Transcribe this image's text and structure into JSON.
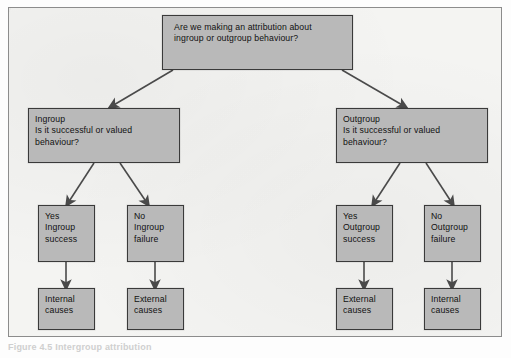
{
  "figure": {
    "caption": "Figure 4.5  Intergroup attribution",
    "colors": {
      "node_fill": "#b9b9b9",
      "node_border": "#3a3a3a",
      "panel_background": "#f4f4f2",
      "panel_border": "#8c8c8c",
      "arrow": "#4a4a4a"
    }
  },
  "nodes": {
    "question_root": "Are we making an attribution about\ningroup or outgroup behaviour?",
    "ingroup_question": "Ingroup\nIs it successful or valued\nbehaviour?",
    "outgroup_question": "Outgroup\nIs it successful or valued\nbehaviour?",
    "ingroup_yes": "Yes\nIngroup\nsuccess",
    "ingroup_no": "No\nIngroup\nfailure",
    "outgroup_yes": "Yes\nOutgroup\nsuccess",
    "outgroup_no": "No\nOutgroup\nfailure",
    "ingroup_yes_outcome": "Internal\ncauses",
    "ingroup_no_outcome": "External\ncauses",
    "outgroup_yes_outcome": "External\ncauses",
    "outgroup_no_outcome": "Internal\ncauses"
  }
}
